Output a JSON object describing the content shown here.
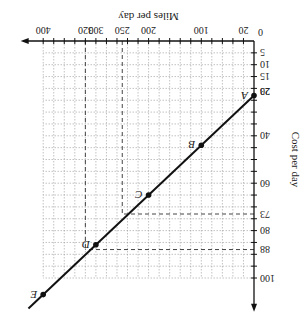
{
  "chart_data": {
    "type": "line",
    "title": "",
    "xlabel": "Miles per day",
    "ylabel": "Cost per day",
    "xlim": [
      0,
      420
    ],
    "ylim": [
      0,
      110
    ],
    "grid": true,
    "orientation_note": "image rendered rotated 180 degrees",
    "x_tick_labels": [
      "20",
      "100",
      "200",
      "250",
      "300",
      "320",
      "400"
    ],
    "x_tick_values": [
      20,
      100,
      200,
      250,
      300,
      320,
      400
    ],
    "y_tick_labels": [
      "5",
      "10",
      "15",
      "20",
      "23",
      "40",
      "60",
      "73",
      "80",
      "88",
      "100"
    ],
    "y_tick_values": [
      5,
      10,
      15,
      20,
      23,
      40,
      60,
      73,
      80,
      88,
      100
    ],
    "origin_label": "0",
    "series": [
      {
        "name": "Cost line",
        "points": [
          {
            "label": "A",
            "x": 0,
            "y": 23
          },
          {
            "label": "B",
            "x": 100,
            "y": 44
          },
          {
            "label": "C",
            "x": 200,
            "y": 65
          },
          {
            "label": "D",
            "x": 300,
            "y": 86
          },
          {
            "label": "E",
            "x": 400,
            "y": 107
          }
        ]
      }
    ],
    "guides": [
      {
        "x": 250,
        "y": 73,
        "style": "dashed"
      },
      {
        "x": 320,
        "y": 88,
        "style": "dashed"
      }
    ]
  }
}
